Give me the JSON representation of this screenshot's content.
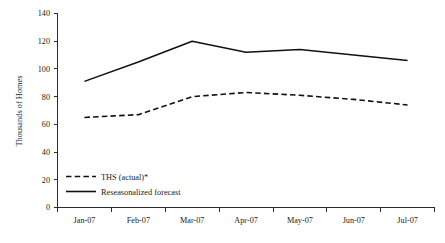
{
  "chart_data": {
    "type": "line",
    "title": "",
    "subtitle": "",
    "xlabel": "",
    "ylabel": "Thousands of Homes",
    "categories": [
      "Jan-07",
      "Feb-07",
      "Mar-07",
      "Apr-07",
      "May-07",
      "Jun-07",
      "Jul-07"
    ],
    "ylim": [
      0,
      140
    ],
    "yticks": [
      0,
      20,
      40,
      60,
      80,
      100,
      120,
      140
    ],
    "ytick_labels": [
      "0",
      "20",
      "40",
      "60",
      "80",
      "100",
      "120",
      "140"
    ],
    "grid": false,
    "legend_position": "inside-lower-left",
    "series": [
      {
        "name": "THS (actual)*",
        "style": "dashed",
        "color": "#111111",
        "values": [
          65,
          67,
          80,
          83,
          81,
          78,
          74
        ]
      },
      {
        "name": "Reseasonalized forecast",
        "style": "solid",
        "color": "#111111",
        "values": [
          91,
          105,
          120,
          112,
          114,
          110,
          106
        ]
      }
    ],
    "annotations": []
  },
  "legend": {
    "entries": [
      {
        "label": "THS (actual)*",
        "style": "dashed"
      },
      {
        "label": "Reseasonalized forecast",
        "style": "solid"
      }
    ]
  },
  "colors": {
    "axis": "#2b2b2b",
    "line": "#111111",
    "background": "#ffffff",
    "text": "#1a1a1a"
  }
}
